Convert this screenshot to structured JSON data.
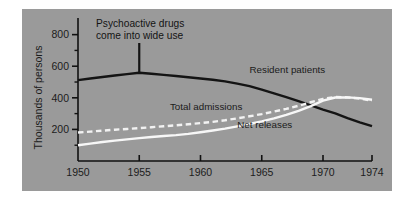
{
  "chart_data": {
    "type": "line",
    "title": "",
    "xlabel": "",
    "ylabel": "Thousands of persons",
    "xlim": [
      1950,
      1974
    ],
    "ylim": [
      0,
      880
    ],
    "yticks": [
      200,
      400,
      600,
      800
    ],
    "ytick_labels": [
      "200",
      "400",
      "600",
      "800"
    ],
    "xticks": [
      1950,
      1955,
      1960,
      1965,
      1970,
      1974
    ],
    "xtick_labels": [
      "1950",
      "1955",
      "1960",
      "1965",
      "1970",
      "1974"
    ],
    "grid": false,
    "legend_position": "inline-annotations",
    "background_color": "#9a9a9a",
    "annotations": [
      {
        "name": "psychoactive-drugs-note",
        "text_line1": "Psychoactive drugs",
        "text_line2": "come into wide use",
        "pointer_year": 1955,
        "pointer_value": 560
      }
    ],
    "series": [
      {
        "name": "Resident patients",
        "style": "solid",
        "color": "#141414",
        "label_year": 1964,
        "label_value": 560,
        "x": [
          1950,
          1951,
          1952,
          1953,
          1954,
          1955,
          1956,
          1957,
          1958,
          1959,
          1960,
          1961,
          1962,
          1963,
          1964,
          1965,
          1966,
          1967,
          1968,
          1969,
          1970,
          1971,
          1972,
          1973,
          1974
        ],
        "values": [
          512,
          522,
          532,
          541,
          550,
          559,
          552,
          545,
          538,
          530,
          522,
          514,
          504,
          490,
          474,
          452,
          428,
          404,
          379,
          352,
          325,
          302,
          272,
          245,
          221
        ]
      },
      {
        "name": "Total admissions",
        "style": "dashed",
        "color": "#f2f2f2",
        "label_year": 1957.5,
        "label_value": 320,
        "x": [
          1950,
          1951,
          1952,
          1953,
          1954,
          1955,
          1956,
          1957,
          1958,
          1959,
          1960,
          1961,
          1962,
          1963,
          1964,
          1965,
          1966,
          1967,
          1968,
          1969,
          1970,
          1971,
          1972,
          1973,
          1974
        ],
        "values": [
          180,
          186,
          192,
          198,
          203,
          208,
          214,
          220,
          226,
          233,
          240,
          248,
          258,
          270,
          283,
          297,
          313,
          330,
          350,
          372,
          393,
          405,
          403,
          395,
          382
        ]
      },
      {
        "name": "Net releases",
        "style": "solid",
        "color": "#f7f7f7",
        "label_year": 1963,
        "label_value": 210,
        "x": [
          1950,
          1951,
          1952,
          1953,
          1954,
          1955,
          1956,
          1957,
          1958,
          1959,
          1960,
          1961,
          1962,
          1963,
          1964,
          1965,
          1966,
          1967,
          1968,
          1969,
          1970,
          1971,
          1972,
          1973,
          1974
        ],
        "values": [
          100,
          110,
          120,
          129,
          137,
          145,
          152,
          158,
          164,
          172,
          182,
          193,
          205,
          219,
          234,
          251,
          270,
          292,
          318,
          348,
          382,
          402,
          403,
          398,
          388
        ]
      }
    ]
  }
}
